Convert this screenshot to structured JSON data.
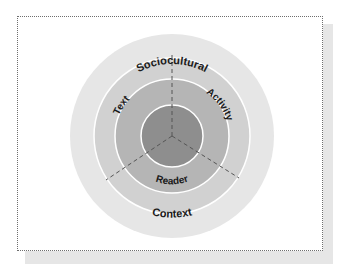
{
  "diagram": {
    "type": "concentric-circles",
    "center": {
      "x": 172,
      "y": 136
    },
    "rings": [
      {
        "name": "sociocultural-context",
        "radius": 102,
        "color": "#e6e6e6"
      },
      {
        "name": "middle-ring",
        "radius": 78,
        "color": "#d1d1d1"
      },
      {
        "name": "text-activity-reader",
        "radius": 57,
        "color": "#b5b5b5"
      },
      {
        "name": "core",
        "radius": 31,
        "color": "#8e8e8e"
      }
    ],
    "labels": {
      "top": "Sociocultural",
      "bottom": "Context",
      "text": "Text",
      "activity": "Activity",
      "reader": "Reader"
    },
    "divider_color": "#555555",
    "ring_stroke": "#ffffff"
  }
}
